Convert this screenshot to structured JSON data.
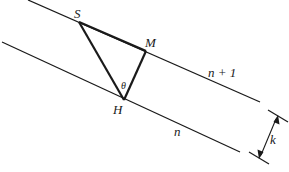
{
  "diagram": {
    "colors": {
      "stroke": "#1a1a1a",
      "background": "#ffffff"
    },
    "lines": {
      "upper": {
        "label": "n + 1",
        "x1": 28,
        "y1": 0,
        "x2": 260,
        "y2": 102
      },
      "lower": {
        "label": "n",
        "x1": 2,
        "y1": 42,
        "x2": 240,
        "y2": 152
      }
    },
    "triangle": {
      "S": {
        "label": "S",
        "x": 79,
        "y": 22
      },
      "M": {
        "label": "M",
        "x": 146,
        "y": 51
      },
      "H": {
        "label": "H",
        "x": 124,
        "y": 100
      },
      "angle_label": "θ"
    },
    "spacing": {
      "label": "k"
    },
    "caption": ""
  }
}
